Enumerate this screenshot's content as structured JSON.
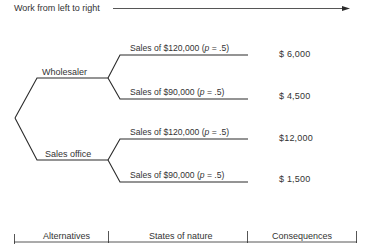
{
  "header": {
    "instruction": "Work from left to right",
    "arrow": "arrow-right"
  },
  "alternatives": [
    {
      "label": "Wholesaler",
      "states": [
        {
          "text_before": "Sales of $120,000 (",
          "p_symbol": "p",
          "text_after": " = .5)",
          "consequence": "$ 6,000"
        },
        {
          "text_before": "Sales of $90,000 (",
          "p_symbol": "p",
          "text_after": " = .5)",
          "consequence": "$ 4,500"
        }
      ]
    },
    {
      "label": "Sales office",
      "states": [
        {
          "text_before": "Sales of $120,000 (",
          "p_symbol": "p",
          "text_after": " = .5)",
          "consequence": "$12,000"
        },
        {
          "text_before": "Sales of $90,000 (",
          "p_symbol": "p",
          "text_after": " = .5)",
          "consequence": "$ 1,500"
        }
      ]
    }
  ],
  "footer": {
    "columns": [
      "Alternatives",
      "States of nature",
      "Consequences"
    ]
  },
  "colors": {
    "line": "#2b2b2b",
    "text": "#333333",
    "background": "#ffffff"
  }
}
